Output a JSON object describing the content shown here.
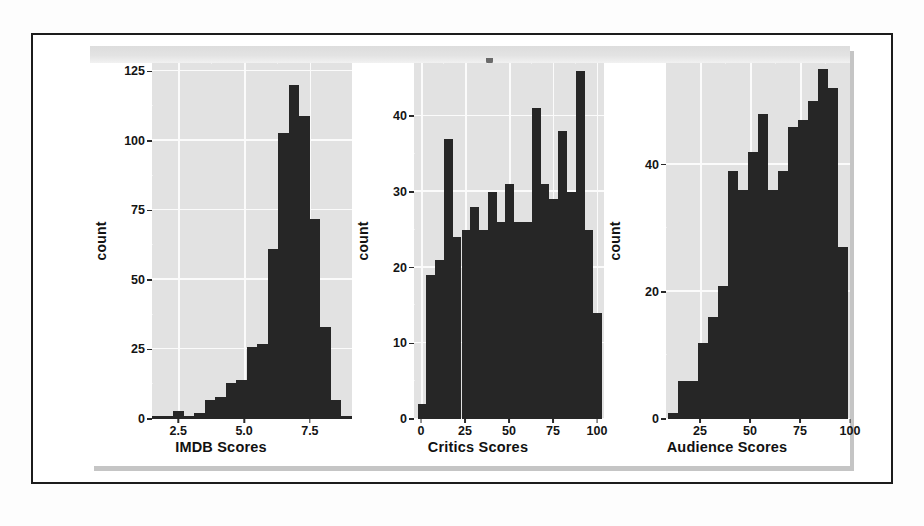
{
  "figure": {
    "caption": "",
    "panel_bg": "#e2e2e2",
    "bar_color": "#262626",
    "grid_color": "#fbfbfb"
  },
  "chart_data": [
    {
      "type": "bar",
      "title": "",
      "xlabel": "IMDB Scores",
      "ylabel": "count",
      "xlim": [
        1.5,
        9.1
      ],
      "ylim": [
        0,
        128
      ],
      "xticks": [
        2.5,
        5.0,
        7.5
      ],
      "xtick_labels": [
        "2.5",
        "5.0",
        "7.5"
      ],
      "yticks": [
        0,
        25,
        50,
        75,
        100,
        125
      ],
      "ytick_labels": [
        "0",
        "25",
        "50",
        "75",
        "100",
        "125"
      ],
      "grid": true,
      "bin_width": 0.4,
      "bin_starts": [
        1.5,
        1.9,
        2.3,
        2.7,
        3.1,
        3.5,
        3.9,
        4.3,
        4.7,
        5.1,
        5.5,
        5.9,
        6.3,
        6.7,
        7.1,
        7.5,
        7.9,
        8.3,
        8.7
      ],
      "values": [
        1,
        1,
        3,
        1,
        2,
        7,
        8,
        13,
        14,
        26,
        27,
        61,
        103,
        120,
        109,
        72,
        33,
        7,
        1
      ]
    },
    {
      "type": "bar",
      "title": "",
      "xlabel": "Critics Scores",
      "ylabel": "count",
      "xlim": [
        -4,
        104
      ],
      "ylim": [
        0,
        47
      ],
      "xticks": [
        0,
        25,
        50,
        75,
        100
      ],
      "xtick_labels": [
        "0",
        "25",
        "50",
        "75",
        "100"
      ],
      "yticks": [
        0,
        10,
        20,
        30,
        40
      ],
      "ytick_labels": [
        "0",
        "10",
        "20",
        "30",
        "40"
      ],
      "grid": true,
      "bin_width": 5,
      "bin_starts": [
        -2,
        3,
        8,
        13,
        18,
        23,
        28,
        33,
        38,
        43,
        48,
        53,
        58,
        63,
        68,
        73,
        78,
        83,
        88,
        93,
        98
      ],
      "values": [
        2,
        19,
        21,
        37,
        24,
        25,
        28,
        25,
        30,
        26,
        31,
        26,
        26,
        41,
        31,
        29,
        38,
        30,
        46,
        25,
        14
      ]
    },
    {
      "type": "bar",
      "title": "",
      "xlabel": "Audience Scores",
      "ylabel": "count",
      "xlim": [
        8,
        100
      ],
      "ylim": [
        0,
        56
      ],
      "xticks": [
        25,
        50,
        75,
        100
      ],
      "xtick_labels": [
        "25",
        "50",
        "75",
        "100"
      ],
      "yticks": [
        0,
        20,
        40
      ],
      "ytick_labels": [
        "0",
        "20",
        "40"
      ],
      "grid": true,
      "bin_width": 5,
      "bin_starts": [
        9,
        14,
        19,
        24,
        29,
        34,
        39,
        44,
        49,
        54,
        59,
        64,
        69,
        74,
        79,
        84,
        89,
        94
      ],
      "values": [
        1,
        6,
        6,
        12,
        16,
        21,
        39,
        36,
        42,
        48,
        36,
        39,
        46,
        47,
        50,
        55,
        52,
        27,
        11
      ]
    }
  ]
}
